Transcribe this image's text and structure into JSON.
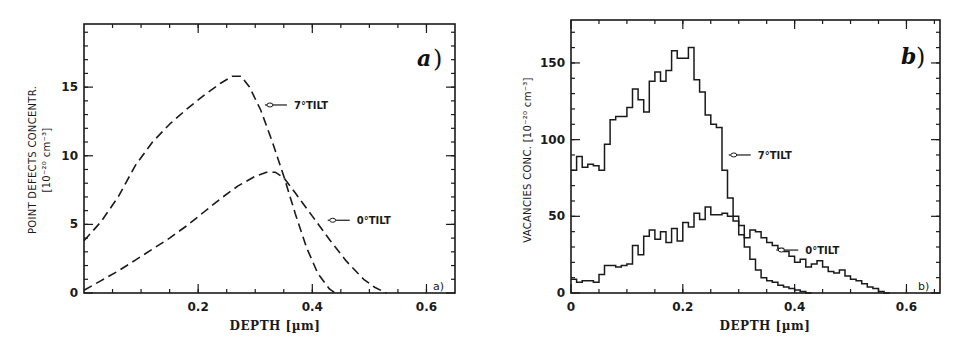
{
  "chart_data": [
    {
      "panel": "a)",
      "corner_tag": "a)",
      "type": "line",
      "xlabel": "DEPTH [µm]",
      "ylabel_line1": "POINT DEFECTS CONCENTR.",
      "ylabel_line2": "[10⁻²⁰ cm⁻³]",
      "xlim": [
        0,
        0.65
      ],
      "ylim": [
        0,
        19.6
      ],
      "xticks": [
        0.2,
        0.4,
        0.6
      ],
      "xtick_labels": [
        "0.2",
        "0.4",
        "0.6"
      ],
      "yticks": [
        0,
        5,
        10,
        15
      ],
      "ytick_labels": [
        "0",
        "5",
        "10",
        "15"
      ],
      "grid": false,
      "line_style": "dashed",
      "series": [
        {
          "name": "7°TILT",
          "x": [
            0.0,
            0.03,
            0.06,
            0.09,
            0.12,
            0.15,
            0.18,
            0.21,
            0.24,
            0.26,
            0.275,
            0.29,
            0.31,
            0.33,
            0.35,
            0.37,
            0.39,
            0.41,
            0.43,
            0.44
          ],
          "y": [
            3.8,
            5.2,
            7.0,
            9.3,
            11.0,
            12.3,
            13.4,
            14.4,
            15.3,
            15.8,
            15.8,
            15.0,
            13.3,
            11.0,
            8.5,
            5.8,
            3.3,
            1.4,
            0.3,
            0.0
          ]
        },
        {
          "name": "0°TILT",
          "x": [
            0.0,
            0.03,
            0.06,
            0.09,
            0.12,
            0.15,
            0.18,
            0.21,
            0.24,
            0.27,
            0.3,
            0.32,
            0.335,
            0.35,
            0.37,
            0.4,
            0.43,
            0.46,
            0.49,
            0.51,
            0.53
          ],
          "y": [
            0.2,
            0.9,
            1.6,
            2.4,
            3.2,
            4.0,
            4.9,
            5.9,
            6.9,
            7.8,
            8.5,
            8.8,
            8.8,
            8.4,
            7.3,
            5.6,
            3.9,
            2.3,
            1.0,
            0.4,
            0.0
          ]
        }
      ],
      "annotations": [
        {
          "text": "7°TILT",
          "arrow_to_x": 0.31,
          "arrow_to_y": 13.7
        },
        {
          "text": "0°TILT",
          "arrow_to_x": 0.42,
          "arrow_to_y": 5.3
        }
      ]
    },
    {
      "panel": "b)",
      "corner_tag": "b)",
      "type": "line",
      "subtype": "step",
      "xlabel": "DEPTH [µm]",
      "ylabel": "VACANCIES CONC. [10⁻²⁰ cm⁻³]",
      "xlim": [
        0,
        0.66
      ],
      "ylim": [
        0,
        178
      ],
      "xticks": [
        0,
        0.2,
        0.4,
        0.6
      ],
      "xtick_labels": [
        "0",
        "0.2",
        "0.4",
        "0.6"
      ],
      "yticks": [
        0,
        50,
        100,
        150
      ],
      "ytick_labels": [
        "0",
        "50",
        "100",
        "150"
      ],
      "grid": false,
      "bin_width": 0.01,
      "series": [
        {
          "name": "7°TILT",
          "x_start": 0.0,
          "values": [
            80,
            89,
            82,
            84,
            83,
            80,
            97,
            113,
            115,
            115,
            121,
            133,
            126,
            118,
            138,
            144,
            138,
            145,
            158,
            153,
            153,
            160,
            139,
            131,
            116,
            110,
            108,
            80,
            62,
            50,
            38,
            30,
            22,
            15,
            10,
            8,
            7,
            5,
            4,
            3,
            2,
            1,
            0
          ]
        },
        {
          "name": "0°TILT",
          "x_start": 0.0,
          "values": [
            9,
            7,
            8,
            8,
            7,
            12,
            18,
            18,
            17,
            18,
            19,
            31,
            25,
            37,
            41,
            35,
            40,
            33,
            42,
            34,
            46,
            43,
            52,
            48,
            56,
            51,
            51,
            52,
            50,
            47,
            44,
            36,
            41,
            40,
            36,
            33,
            31,
            29,
            27,
            24,
            20,
            22,
            17,
            19,
            21,
            17,
            14,
            13,
            15,
            11,
            9,
            8,
            6,
            4,
            3,
            1,
            0
          ]
        }
      ],
      "annotations": [
        {
          "text": "7°TILT",
          "arrow_to_x": 0.275,
          "arrow_to_y": 90
        },
        {
          "text": "0°TILT",
          "arrow_to_x": 0.36,
          "arrow_to_y": 28
        }
      ]
    }
  ]
}
